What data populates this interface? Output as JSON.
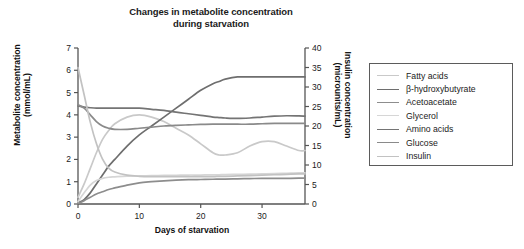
{
  "chart_data": {
    "type": "line",
    "title": "Changes in metabolite concentration during starvation",
    "title_line1": "Changes in metabolite concentration",
    "title_line2": "during starvation",
    "xlabel": "Days of starvation",
    "ylabel": "Metabolite concentration (mmol/mL)",
    "ylabel_line1": "Metabolite concentration",
    "ylabel_line2": "(mmol/mL)",
    "y2label": "Insulin concentration (microunits/mL)",
    "y2label_line1": "Insulin concentration",
    "y2label_line2": "(microunits/mL)",
    "xlim": [
      0,
      37
    ],
    "ylim": [
      0,
      7
    ],
    "y2lim": [
      0,
      40
    ],
    "xticks": [
      0,
      10,
      20,
      30
    ],
    "xtick_labels": [
      "0",
      "10",
      "20",
      "30"
    ],
    "yticks": [
      0,
      1,
      2,
      3,
      4,
      5,
      6,
      7
    ],
    "ytick_labels": [
      "0",
      "1",
      "2",
      "3",
      "4",
      "5",
      "6",
      "7"
    ],
    "y2ticks": [
      0,
      5,
      10,
      15,
      20,
      25,
      30,
      35,
      40
    ],
    "y2tick_labels": [
      "0",
      "5",
      "10",
      "15",
      "20",
      "25",
      "30",
      "35",
      "40"
    ],
    "grid": false,
    "legend_position": "right-outside",
    "x": [
      0,
      1,
      2,
      3,
      4,
      5,
      6,
      8,
      10,
      12,
      14,
      16,
      18,
      20,
      22,
      23,
      24,
      26,
      28,
      30,
      32,
      34,
      36,
      37
    ],
    "series": [
      {
        "name": "Fatty acids",
        "axis": "left",
        "color": "#c9c9c9",
        "values": [
          0.3,
          0.9,
          1.6,
          2.3,
          2.9,
          3.3,
          3.6,
          3.9,
          4.0,
          3.9,
          3.7,
          3.4,
          3.1,
          2.7,
          2.3,
          2.2,
          2.2,
          2.3,
          2.6,
          2.8,
          2.8,
          2.6,
          2.4,
          2.4
        ]
      },
      {
        "name": "β-hydroxybutyrate",
        "axis": "left",
        "color": "#6e6e6e",
        "values": [
          0.05,
          0.2,
          0.5,
          0.9,
          1.3,
          1.7,
          2.0,
          2.6,
          3.1,
          3.5,
          3.9,
          4.3,
          4.7,
          5.1,
          5.4,
          5.5,
          5.6,
          5.7,
          5.7,
          5.7,
          5.7,
          5.7,
          5.7,
          5.7
        ]
      },
      {
        "name": "Acetoacetate",
        "axis": "left",
        "color": "#8d8d8d",
        "values": [
          0.02,
          0.15,
          0.3,
          0.45,
          0.55,
          0.65,
          0.72,
          0.85,
          0.95,
          1.0,
          1.04,
          1.07,
          1.09,
          1.1,
          1.11,
          1.12,
          1.12,
          1.13,
          1.14,
          1.15,
          1.15,
          1.15,
          1.16,
          1.16
        ]
      },
      {
        "name": "Glycerol",
        "axis": "left",
        "color": "#d6d6d6",
        "values": [
          0.1,
          0.5,
          0.85,
          1.05,
          1.15,
          1.2,
          1.22,
          1.25,
          1.26,
          1.27,
          1.28,
          1.29,
          1.3,
          1.3,
          1.31,
          1.31,
          1.32,
          1.33,
          1.34,
          1.35,
          1.36,
          1.38,
          1.4,
          1.4
        ]
      },
      {
        "name": "Amino acids",
        "axis": "left",
        "color": "#747474",
        "values": [
          4.4,
          4.35,
          4.32,
          4.3,
          4.3,
          4.3,
          4.3,
          4.3,
          4.3,
          4.25,
          4.2,
          4.12,
          4.05,
          3.98,
          3.9,
          3.88,
          3.86,
          3.84,
          3.86,
          3.9,
          3.94,
          3.96,
          3.95,
          3.94
        ]
      },
      {
        "name": "Glucose",
        "axis": "left",
        "color": "#8a8a8a",
        "values": [
          4.45,
          4.3,
          4.0,
          3.7,
          3.5,
          3.4,
          3.35,
          3.35,
          3.4,
          3.45,
          3.5,
          3.53,
          3.55,
          3.57,
          3.58,
          3.58,
          3.58,
          3.58,
          3.58,
          3.6,
          3.62,
          3.62,
          3.62,
          3.62
        ]
      },
      {
        "name": "Insulin",
        "axis": "right",
        "color": "#c2c2c2",
        "values": [
          35.0,
          28.0,
          21.0,
          15.5,
          11.5,
          9.2,
          8.2,
          7.4,
          7.1,
          7.0,
          7.0,
          7.0,
          7.0,
          7.0,
          7.0,
          7.1,
          7.1,
          7.2,
          7.3,
          7.4,
          7.5,
          7.6,
          7.7,
          7.7
        ]
      }
    ]
  },
  "legend": {
    "items": [
      {
        "label": "Fatty acids",
        "color": "#c9c9c9"
      },
      {
        "label": "β-hydroxybutyrate",
        "color": "#6e6e6e"
      },
      {
        "label": "Acetoacetate",
        "color": "#8d8d8d"
      },
      {
        "label": "Glycerol",
        "color": "#d6d6d6"
      },
      {
        "label": "Amino acids",
        "color": "#747474"
      },
      {
        "label": "Glucose",
        "color": "#8a8a8a"
      },
      {
        "label": "Insulin",
        "color": "#c2c2c2"
      }
    ]
  }
}
